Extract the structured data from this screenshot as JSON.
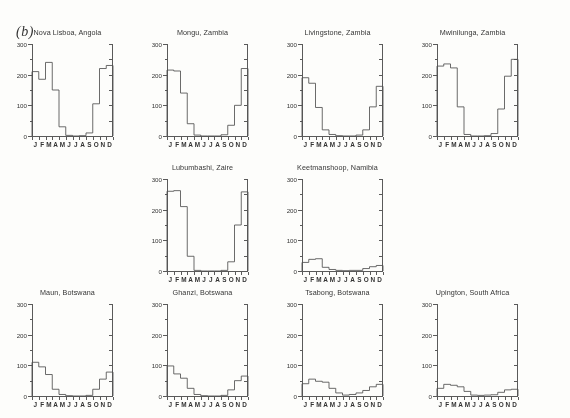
{
  "figure": {
    "label": "(b)",
    "months": [
      "J",
      "F",
      "M",
      "A",
      "M",
      "J",
      "J",
      "A",
      "S",
      "O",
      "N",
      "D"
    ],
    "y_ticks_major": [
      0,
      100,
      200,
      300
    ],
    "y_tick_labels": [
      "0",
      "100",
      "200",
      "300"
    ],
    "y_ticks_minor": [
      50,
      150,
      250
    ],
    "ylim": [
      0,
      300
    ],
    "accent_color": "#4a4a4a",
    "axis_color": "#555555",
    "background_color": "#fdfdfb"
  },
  "chart_data": [
    {
      "type": "line",
      "title": "Nova Lisboa, Angola",
      "categories": [
        "J",
        "F",
        "M",
        "A",
        "M",
        "J",
        "J",
        "A",
        "S",
        "O",
        "N",
        "D"
      ],
      "values": [
        210,
        185,
        240,
        150,
        30,
        2,
        0,
        1,
        10,
        105,
        220,
        230
      ],
      "xlabel": "",
      "ylabel": "",
      "ylim": [
        0,
        300
      ],
      "grid": false,
      "row": 1,
      "col": 1
    },
    {
      "type": "line",
      "title": "Mongu, Zambia",
      "categories": [
        "J",
        "F",
        "M",
        "A",
        "M",
        "J",
        "J",
        "A",
        "S",
        "O",
        "N",
        "D"
      ],
      "values": [
        215,
        212,
        140,
        40,
        3,
        0,
        0,
        0,
        4,
        35,
        100,
        220
      ],
      "xlabel": "",
      "ylabel": "",
      "ylim": [
        0,
        300
      ],
      "grid": false,
      "row": 1,
      "col": 2
    },
    {
      "type": "line",
      "title": "Livingstone, Zambia",
      "categories": [
        "J",
        "F",
        "M",
        "A",
        "M",
        "J",
        "J",
        "A",
        "S",
        "O",
        "N",
        "D"
      ],
      "values": [
        190,
        172,
        93,
        20,
        5,
        1,
        0,
        0,
        3,
        20,
        95,
        162
      ],
      "xlabel": "",
      "ylabel": "",
      "ylim": [
        0,
        300
      ],
      "grid": false,
      "row": 1,
      "col": 3
    },
    {
      "type": "line",
      "title": "Mwinilunga, Zambia",
      "categories": [
        "J",
        "F",
        "M",
        "A",
        "M",
        "J",
        "J",
        "A",
        "S",
        "O",
        "N",
        "D"
      ],
      "values": [
        228,
        235,
        222,
        95,
        5,
        0,
        0,
        1,
        8,
        88,
        195,
        250
      ],
      "xlabel": "",
      "ylabel": "",
      "ylim": [
        0,
        300
      ],
      "grid": false,
      "row": 1,
      "col": 4
    },
    {
      "type": "line",
      "title": "Lubumbashi, Zaire",
      "categories": [
        "J",
        "F",
        "M",
        "A",
        "M",
        "J",
        "J",
        "A",
        "S",
        "O",
        "N",
        "D"
      ],
      "values": [
        260,
        262,
        210,
        48,
        2,
        0,
        0,
        0,
        2,
        30,
        150,
        258
      ],
      "xlabel": "",
      "ylabel": "",
      "ylim": [
        0,
        300
      ],
      "grid": false,
      "row": 2,
      "col": 2
    },
    {
      "type": "line",
      "title": "Keetmanshoop, Namibia",
      "categories": [
        "J",
        "F",
        "M",
        "A",
        "M",
        "J",
        "J",
        "A",
        "S",
        "O",
        "N",
        "D"
      ],
      "values": [
        28,
        38,
        40,
        12,
        5,
        2,
        1,
        2,
        2,
        8,
        14,
        18
      ],
      "xlabel": "",
      "ylabel": "",
      "ylim": [
        0,
        300
      ],
      "grid": false,
      "row": 2,
      "col": 3
    },
    {
      "type": "line",
      "title": "Maun, Botswana",
      "categories": [
        "J",
        "F",
        "M",
        "A",
        "M",
        "J",
        "J",
        "A",
        "S",
        "O",
        "N",
        "D"
      ],
      "values": [
        110,
        95,
        70,
        22,
        5,
        1,
        0,
        0,
        2,
        22,
        55,
        78
      ],
      "xlabel": "",
      "ylabel": "",
      "ylim": [
        0,
        300
      ],
      "grid": false,
      "row": 3,
      "col": 1
    },
    {
      "type": "line",
      "title": "Ghanzi, Botswana",
      "categories": [
        "J",
        "F",
        "M",
        "A",
        "M",
        "J",
        "J",
        "A",
        "S",
        "O",
        "N",
        "D"
      ],
      "values": [
        98,
        72,
        58,
        25,
        5,
        1,
        0,
        0,
        2,
        20,
        50,
        65
      ],
      "xlabel": "",
      "ylabel": "",
      "ylim": [
        0,
        300
      ],
      "grid": false,
      "row": 3,
      "col": 2
    },
    {
      "type": "line",
      "title": "Tsabong, Botswana",
      "categories": [
        "J",
        "F",
        "M",
        "A",
        "M",
        "J",
        "J",
        "A",
        "S",
        "O",
        "N",
        "D"
      ],
      "values": [
        40,
        55,
        48,
        45,
        25,
        10,
        3,
        5,
        10,
        18,
        30,
        38
      ],
      "xlabel": "",
      "ylabel": "",
      "ylim": [
        0,
        300
      ],
      "grid": false,
      "row": 3,
      "col": 3
    },
    {
      "type": "line",
      "title": "Upington, South Africa",
      "categories": [
        "J",
        "F",
        "M",
        "A",
        "M",
        "J",
        "J",
        "A",
        "S",
        "O",
        "N",
        "D"
      ],
      "values": [
        25,
        38,
        35,
        30,
        15,
        3,
        2,
        3,
        4,
        12,
        20,
        22
      ],
      "xlabel": "",
      "ylabel": "",
      "ylim": [
        0,
        300
      ],
      "grid": false,
      "row": 3,
      "col": 4
    }
  ]
}
